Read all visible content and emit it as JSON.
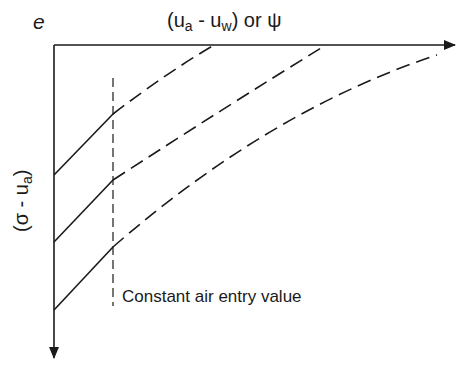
{
  "diagram": {
    "title": "",
    "axes": {
      "vertical_top_label": "e",
      "horizontal_label": {
        "prefix": "(u",
        "sub1": "a",
        "mid": " - u",
        "sub2": "w",
        "suffix": ") or ψ"
      },
      "vertical_label": {
        "prefix": "(σ - u",
        "sub": "a",
        "suffix": ")"
      }
    },
    "annotations": {
      "air_entry": "Constant air entry value"
    },
    "curves": [
      {
        "name": "curve-1",
        "solid_segment": "linear until air entry",
        "dashed_segment": "curving to horizontal axis"
      },
      {
        "name": "curve-2",
        "solid_segment": "linear until air entry",
        "dashed_segment": "curving to horizontal axis"
      },
      {
        "name": "curve-3",
        "solid_segment": "linear until air entry",
        "dashed_segment": "curving toward horizontal axis"
      }
    ],
    "colors": {
      "line": "#1a1a1a",
      "background": "#ffffff"
    }
  }
}
